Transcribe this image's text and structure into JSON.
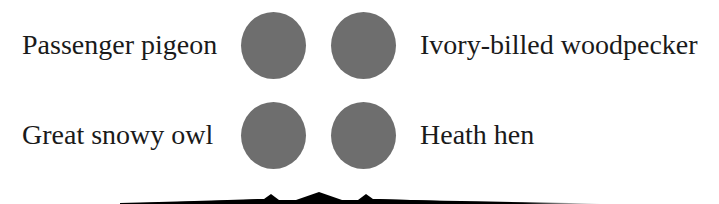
{
  "diagram": {
    "type": "labeled-dot-grid",
    "dot_color": "#6e6e6e",
    "items": [
      {
        "label": "Passenger pigeon",
        "position": "top-left"
      },
      {
        "label": "Ivory-billed woodpecker",
        "position": "top-right"
      },
      {
        "label": "Great snowy owl",
        "position": "bottom-left"
      },
      {
        "label": "Heath hen",
        "position": "bottom-right"
      }
    ],
    "connector": "brace"
  }
}
